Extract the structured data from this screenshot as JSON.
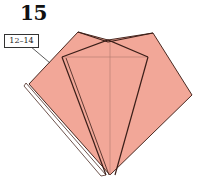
{
  "step": {
    "number": "15"
  },
  "reference": {
    "label": "12–14"
  },
  "colors": {
    "paper": "#f2a798",
    "edge": "#4a2a22",
    "crease": "#b07a70",
    "white_flap": "#ffffff"
  },
  "shape": {
    "outline": [
      [
        78,
        32
      ],
      [
        108,
        40
      ],
      [
        153,
        33
      ],
      [
        192,
        95
      ],
      [
        110,
        175
      ],
      [
        26,
        83
      ]
    ],
    "left_white_edge": [
      [
        26,
        83
      ],
      [
        30,
        86
      ],
      [
        106,
        175
      ]
    ],
    "inner_left_flap": [
      [
        62,
        57
      ],
      [
        106,
        175
      ]
    ],
    "inner_left_flap2": [
      [
        66,
        57
      ],
      [
        109,
        175
      ]
    ],
    "inner_right_flap": [
      [
        148,
        57
      ],
      [
        116,
        175
      ]
    ],
    "top_folds": [
      [
        [
          62,
          57
        ],
        [
          108,
          40
        ],
        [
          148,
          57
        ]
      ],
      [
        [
          78,
          32
        ],
        [
          108,
          42
        ],
        [
          153,
          33
        ]
      ]
    ],
    "creases": [
      [
        [
          62,
          57
        ],
        [
          148,
          57
        ]
      ],
      [
        [
          110,
          40
        ],
        [
          110,
          175
        ]
      ]
    ],
    "leader": [
      [
        30,
        46
      ],
      [
        50,
        62
      ]
    ]
  }
}
